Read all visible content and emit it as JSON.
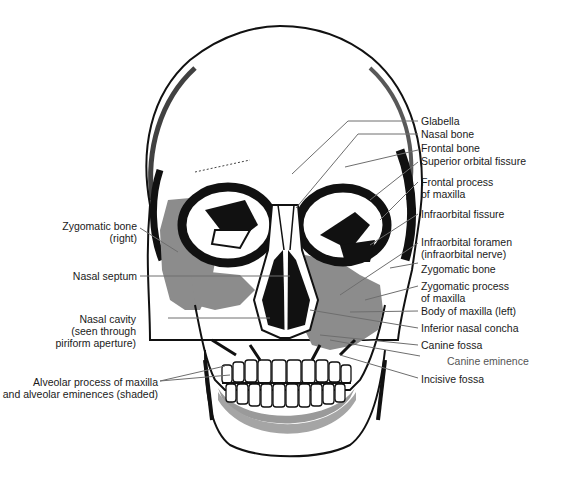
{
  "figure": {
    "colors": {
      "ink": "#111111",
      "shade": "#8c8c8c",
      "leader": "#6e6e6e",
      "background": "#ffffff"
    }
  },
  "labels_right": [
    {
      "id": "glabella",
      "lines": [
        "Glabella"
      ]
    },
    {
      "id": "nasal-bone",
      "lines": [
        "Nasal bone"
      ]
    },
    {
      "id": "frontal-bone",
      "lines": [
        "Frontal bone"
      ]
    },
    {
      "id": "superior-orbital-fissure",
      "lines": [
        "Superior orbital fissure"
      ]
    },
    {
      "id": "frontal-process-of-maxilla",
      "lines": [
        "Frontal process",
        "of maxilla"
      ]
    },
    {
      "id": "infraorbital-fissure",
      "lines": [
        "Infraorbital fissure"
      ]
    },
    {
      "id": "infraorbital-foramen",
      "lines": [
        "Infraorbital foramen",
        "(infraorbital nerve)"
      ]
    },
    {
      "id": "zygomatic-bone",
      "lines": [
        "Zygomatic bone"
      ]
    },
    {
      "id": "zygomatic-process-of-maxilla",
      "lines": [
        "Zygomatic process",
        "of maxilla"
      ]
    },
    {
      "id": "body-of-maxilla-left",
      "lines": [
        "Body of maxilla (left)"
      ]
    },
    {
      "id": "inferior-nasal-concha",
      "lines": [
        "Inferior nasal concha"
      ]
    },
    {
      "id": "canine-fossa",
      "lines": [
        "Canine fossa"
      ]
    },
    {
      "id": "canine-eminence",
      "lines": [
        "Canine eminence"
      ]
    },
    {
      "id": "incisive-fossa",
      "lines": [
        "Incisive fossa"
      ]
    }
  ],
  "labels_left": [
    {
      "id": "zygomatic-bone-right",
      "lines": [
        "Zygomatic bone",
        "(right)"
      ]
    },
    {
      "id": "nasal-septum",
      "lines": [
        "Nasal septum"
      ]
    },
    {
      "id": "nasal-cavity",
      "lines": [
        "Nasal cavity",
        "(seen through",
        "piriform aperture)"
      ]
    },
    {
      "id": "alveolar-process",
      "lines": [
        "Alveolar process of maxilla",
        "and alveolar eminences (shaded)"
      ]
    }
  ]
}
